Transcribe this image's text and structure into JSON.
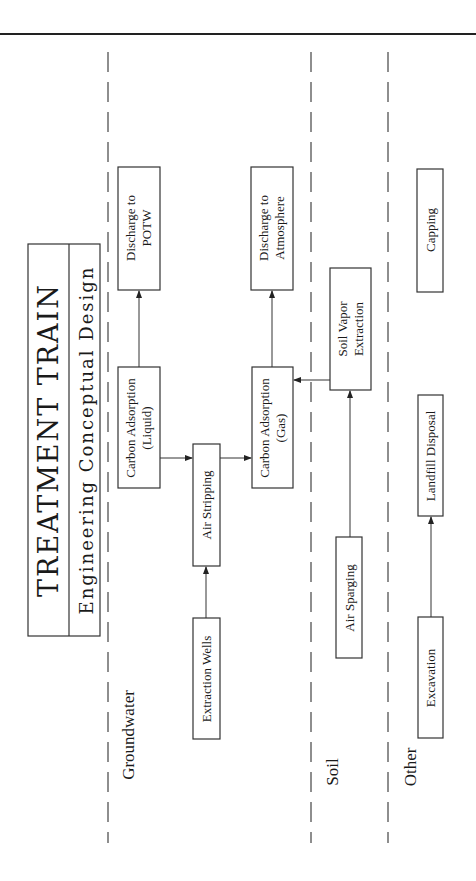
{
  "title": {
    "main": "TREATMENT TRAIN",
    "subtitle": "Engineering Conceptual Design"
  },
  "sections": [
    {
      "id": "groundwater",
      "label": "Groundwater"
    },
    {
      "id": "soil",
      "label": "Soil"
    },
    {
      "id": "other",
      "label": "Other"
    }
  ],
  "nodes": {
    "extraction_wells": {
      "line1": "Extraction Wells",
      "line2": ""
    },
    "air_stripping": {
      "line1": "Air Stripping",
      "line2": ""
    },
    "carbon_adsorption_liquid": {
      "line1": "Carbon Adsorption",
      "line2": "(Liquid)"
    },
    "carbon_adsorption_gas": {
      "line1": "Carbon Adsorption",
      "line2": "(Gas)"
    },
    "discharge_potw": {
      "line1": "Discharge to",
      "line2": "POTW"
    },
    "discharge_atmosphere": {
      "line1": "Discharge to",
      "line2": "Atmosphere"
    },
    "soil_vapor_extraction": {
      "line1": "Soil Vapor",
      "line2": "Extraction"
    },
    "air_sparging": {
      "line1": "Air Sparging",
      "line2": ""
    },
    "excavation": {
      "line1": "Excavation",
      "line2": ""
    },
    "landfill_disposal": {
      "line1": "Landfill Disposal",
      "line2": ""
    },
    "capping": {
      "line1": "Capping",
      "line2": ""
    }
  },
  "edges": [
    {
      "from": "Extraction Wells",
      "to": "Air Stripping"
    },
    {
      "from": "Carbon Adsorption (Liquid)",
      "to": "Air Stripping"
    },
    {
      "from": "Air Stripping",
      "to": "Carbon Adsorption (Gas)"
    },
    {
      "from": "Carbon Adsorption (Liquid)",
      "to": "Discharge to POTW"
    },
    {
      "from": "Carbon Adsorption (Gas)",
      "to": "Discharge to Atmosphere"
    },
    {
      "from": "Soil Vapor Extraction",
      "to": "Carbon Adsorption (Gas)"
    },
    {
      "from": "Air Sparging",
      "to": "Soil Vapor Extraction"
    },
    {
      "from": "Excavation",
      "to": "Landfill Disposal"
    }
  ]
}
